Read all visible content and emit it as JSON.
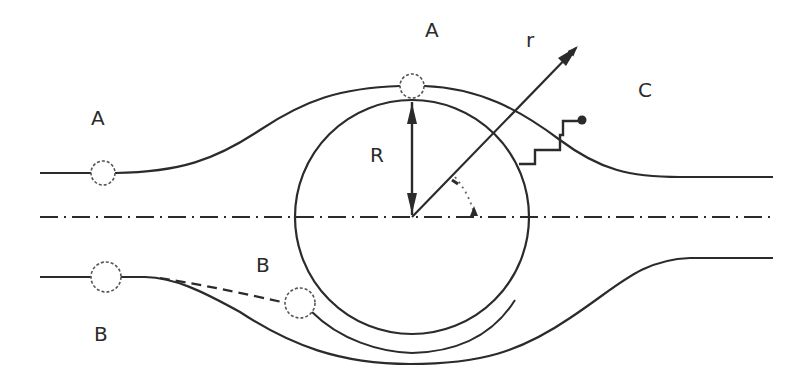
{
  "diagram": {
    "title": "",
    "labels": {
      "top_left_A": "A",
      "top_center_A": "A",
      "radius_r": "r",
      "region_C": "C",
      "radius_R": "R",
      "lower_B_near_circle": "B",
      "bottom_left_B": "B"
    },
    "elements": [
      {
        "id": "streamline-upper",
        "kind": "streamline",
        "style": "solid"
      },
      {
        "id": "streamline-lower",
        "kind": "streamline",
        "style": "solid"
      },
      {
        "id": "cylinder",
        "kind": "circle",
        "label": "R"
      },
      {
        "id": "centerline",
        "kind": "axis",
        "style": "dash-dot"
      },
      {
        "id": "radius-vector",
        "kind": "arrow",
        "label": "r"
      },
      {
        "id": "radius-R",
        "kind": "double-arrow",
        "label": "R"
      },
      {
        "id": "angle-marker",
        "kind": "angle",
        "style": "dotted"
      },
      {
        "id": "staircase-path",
        "kind": "path",
        "end": "dot"
      },
      {
        "id": "particle-A-left",
        "kind": "particle",
        "label": "A"
      },
      {
        "id": "particle-A-top",
        "kind": "particle",
        "label": "A"
      },
      {
        "id": "particle-B-left",
        "kind": "particle",
        "label": "B"
      },
      {
        "id": "particle-B-near",
        "kind": "particle",
        "label": "B"
      }
    ],
    "colors": {
      "line": "#2b2b2b",
      "background": "#ffffff",
      "particle_outline": "#555555"
    }
  }
}
